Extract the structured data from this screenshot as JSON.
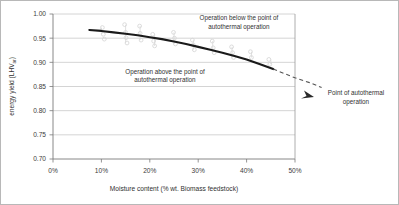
{
  "chart_data": {
    "type": "line",
    "title": "",
    "xlabel": "Moisture content (%  wt. Biomass feedstock)",
    "ylabel": "energy yield (LHVar)",
    "ylabel_main": "energy yield (LHV",
    "ylabel_sub": "ar",
    "ylabel_tail": ")",
    "xlim": [
      0,
      50
    ],
    "ylim": [
      0.7,
      1.0
    ],
    "grid": "horizontal",
    "legend": "none",
    "xticks": [
      0,
      10,
      20,
      30,
      40,
      50
    ],
    "xtick_labels": [
      "0%",
      "10%",
      "20%",
      "30%",
      "40%",
      "50%"
    ],
    "yticks": [
      0.7,
      0.75,
      0.8,
      0.85,
      0.9,
      0.95,
      1.0
    ],
    "ytick_labels": [
      "0.70",
      "0.75",
      "0.80",
      "0.85",
      "0.90",
      "0.95",
      "1.00"
    ],
    "series": [
      {
        "name": "energy yield curve (solid)",
        "style": "solid",
        "color": "#1a1a1a",
        "x": [
          7.5,
          10,
          12.5,
          15,
          17.5,
          20,
          22.5,
          25,
          27.5,
          30,
          32.5,
          35,
          37.5,
          40,
          42.5,
          45.5
        ],
        "y": [
          0.967,
          0.965,
          0.962,
          0.959,
          0.956,
          0.952,
          0.948,
          0.943,
          0.938,
          0.932,
          0.926,
          0.92,
          0.913,
          0.906,
          0.897,
          0.886
        ]
      },
      {
        "name": "extrapolation (dashed)",
        "style": "dashed",
        "color": "#555555",
        "x": [
          45.5,
          48,
          50,
          53,
          55.5
        ],
        "y": [
          0.886,
          0.876,
          0.868,
          0.858,
          0.848
        ]
      },
      {
        "name": "scatter data (faint)",
        "style": "scatter",
        "color": "#d8d8d8",
        "points": [
          [
            10.2,
            0.972
          ],
          [
            10.4,
            0.958
          ],
          [
            10.6,
            0.948
          ],
          [
            14.8,
            0.978
          ],
          [
            15.0,
            0.962
          ],
          [
            15.1,
            0.951
          ],
          [
            15.3,
            0.94
          ],
          [
            17.9,
            0.975
          ],
          [
            18.0,
            0.96
          ],
          [
            18.2,
            0.946
          ],
          [
            20.6,
            0.958
          ],
          [
            20.8,
            0.944
          ],
          [
            21.0,
            0.934
          ],
          [
            24.9,
            0.962
          ],
          [
            25.1,
            0.95
          ],
          [
            25.3,
            0.938
          ],
          [
            28.8,
            0.946
          ],
          [
            29.0,
            0.936
          ],
          [
            29.2,
            0.926
          ],
          [
            32.9,
            0.944
          ],
          [
            33.1,
            0.93
          ],
          [
            33.3,
            0.92
          ],
          [
            36.9,
            0.932
          ],
          [
            37.1,
            0.92
          ],
          [
            37.3,
            0.91
          ],
          [
            40.8,
            0.922
          ],
          [
            41.0,
            0.91
          ],
          [
            44.6,
            0.906
          ],
          [
            44.8,
            0.896
          ]
        ]
      }
    ],
    "annotations": [
      {
        "name": "annotation-below-point",
        "lines": [
          "Operation below the point of",
          "autothermal operation"
        ],
        "position": "inside-upper-right"
      },
      {
        "name": "annotation-above-point",
        "lines": [
          "Operation above the point of",
          "autothermal operation"
        ],
        "position": "inside-center-left"
      },
      {
        "name": "annotation-point-of-autothermal-operation",
        "lines": [
          "Point of autothermal",
          "operation"
        ],
        "position": "outside-right",
        "has_arrow": true
      }
    ],
    "colors": {
      "curve": "#1a1a1a",
      "dashed": "#555555",
      "gridline": "#c9c9c9",
      "axis": "#808080",
      "text": "#303030",
      "scatter": "#d8d8d8",
      "frame": "#b8b8b8"
    }
  }
}
